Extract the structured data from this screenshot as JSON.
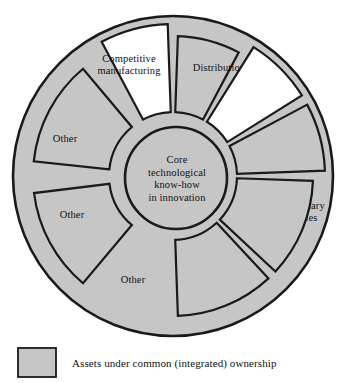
{
  "figure": {
    "type": "radial-hub-and-spoke-diagram",
    "center": {
      "lines": [
        "Core",
        "technological",
        "know-how",
        "in innovation"
      ]
    },
    "colors": {
      "filled": "#c6c6c6",
      "unfilled": "#ffffff",
      "outline": "#1a1a1a",
      "text": "#111111",
      "background": "#ffffff"
    },
    "segments": [
      {
        "id": "competitive-manufacturing",
        "lines": [
          "Competitive",
          "manufacturing"
        ],
        "ownership": "external",
        "filled": false,
        "extended": true,
        "start_angle": -118,
        "end_angle": -92,
        "label_x": 129,
        "label_y": 66
      },
      {
        "id": "distribution",
        "lines": [
          "Distribution"
        ],
        "ownership": "integrated",
        "filled": true,
        "extended": false,
        "start_angle": -88,
        "end_angle": -62,
        "label_x": 219,
        "label_y": 69
      },
      {
        "id": "service",
        "lines": [
          "Service"
        ],
        "ownership": "external",
        "filled": false,
        "extended": true,
        "start_angle": -58,
        "end_angle": -32,
        "label_x": 285,
        "label_y": 137
      },
      {
        "id": "complementary-technologies",
        "lines": [
          "Complementary",
          "technologies"
        ],
        "ownership": "integrated",
        "filled": true,
        "extended": true,
        "start_angle": -28,
        "end_angle": -2,
        "label_x": 290,
        "label_y": 213
      },
      {
        "id": "other-lower-right",
        "lines": [
          "Other"
        ],
        "ownership": "integrated",
        "filled": true,
        "extended": false,
        "start_angle": 2,
        "end_angle": 43,
        "label_x": 224,
        "label_y": 281
      },
      {
        "id": "other-lower-left",
        "lines": [
          "Other"
        ],
        "ownership": "integrated",
        "filled": true,
        "extended": false,
        "start_angle": 47,
        "end_angle": 88,
        "label_x": 133,
        "label_y": 281
      },
      {
        "id": "other-left-lower",
        "lines": [
          "Other"
        ],
        "ownership": "integrated",
        "filled": true,
        "extended": false,
        "start_angle": 130,
        "end_angle": 173,
        "label_x": 72,
        "label_y": 216
      },
      {
        "id": "other-left-upper",
        "lines": [
          "Other"
        ],
        "ownership": "integrated",
        "filled": true,
        "extended": false,
        "start_angle": -174,
        "end_angle": -130,
        "label_x": 65,
        "label_y": 140
      }
    ],
    "legend": {
      "swatch_label": "filled-swatch",
      "text": "Assets under common (integrated) ownership"
    }
  }
}
